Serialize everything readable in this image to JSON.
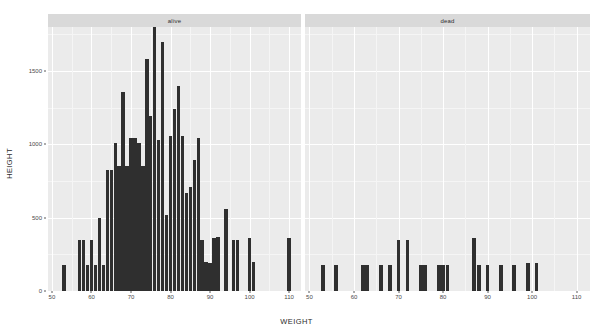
{
  "chart_data": {
    "type": "bar",
    "title": "",
    "subtitle": "",
    "xlabel": "WEIGHT",
    "ylabel": "HEIGHT",
    "xlim": [
      49,
      113
    ],
    "ylim": [
      0,
      1800
    ],
    "grid": true,
    "legend_position": "none",
    "facet_variable": "status",
    "bin_width": 1,
    "x_ticks": [
      50,
      60,
      70,
      80,
      90,
      100,
      110
    ],
    "x_tick_labels": [
      "50",
      "60",
      "70",
      "80",
      "90",
      "100",
      "110"
    ],
    "y_ticks": [
      0,
      500,
      1000,
      1500
    ],
    "y_tick_labels": [
      "0",
      "500",
      "1000",
      "1500"
    ],
    "panels": [
      {
        "label": "alive",
        "x": [
          53,
          57,
          58,
          59,
          60,
          61,
          62,
          63,
          64,
          65,
          66,
          67,
          68,
          69,
          70,
          71,
          72,
          73,
          74,
          75,
          76,
          77,
          78,
          79,
          80,
          81,
          82,
          83,
          84,
          85,
          86,
          87,
          88,
          89,
          90,
          91,
          92,
          94,
          96,
          97,
          100,
          101,
          110
        ],
        "values": [
          175,
          350,
          350,
          175,
          350,
          175,
          500,
          175,
          825,
          825,
          1010,
          855,
          1360,
          855,
          1040,
          1045,
          1010,
          855,
          1580,
          1190,
          1830,
          1030,
          1700,
          520,
          1060,
          1240,
          1400,
          1055,
          670,
          710,
          890,
          1040,
          350,
          200,
          190,
          360,
          370,
          560,
          350,
          350,
          360,
          200,
          360
        ]
      },
      {
        "label": "dead",
        "x": [
          53,
          56,
          62,
          63,
          66,
          68,
          70,
          72,
          75,
          76,
          79,
          80,
          81,
          87,
          88,
          90,
          93,
          96,
          99,
          101
        ],
        "values": [
          180,
          180,
          180,
          180,
          180,
          180,
          350,
          350,
          180,
          180,
          180,
          180,
          180,
          360,
          180,
          180,
          180,
          180,
          190,
          190
        ]
      }
    ]
  },
  "axes": {
    "y_title": "HEIGHT",
    "x_title": "WEIGHT"
  }
}
